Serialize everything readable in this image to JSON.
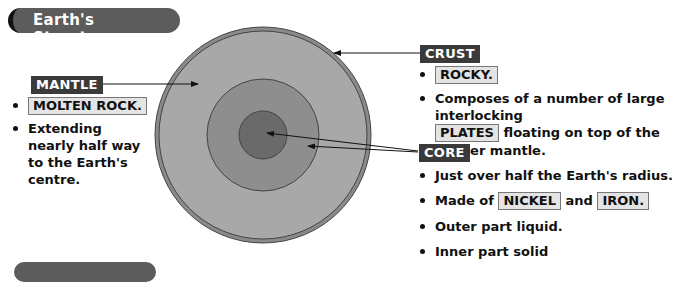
{
  "header": {
    "title": "Earth's Structure"
  },
  "diagram": {
    "colors": {
      "crust": "#8a8a8a",
      "mantle": "#a8a8a8",
      "outer_core": "#8e8e8e",
      "inner_core": "#6a6a6a",
      "label_bg": "#3a3a3a",
      "highlight_bg": "#e4e4e4"
    }
  },
  "mantle": {
    "label": "MANTLE",
    "bullets": [
      {
        "highlight": "MOLTEN ROCK."
      },
      {
        "text": "Extending nearly half way to the Earth's centre."
      }
    ]
  },
  "crust": {
    "label": "CRUST",
    "bullets": [
      {
        "highlight": "ROCKY."
      },
      {
        "text_before": "Composes of a number of large interlocking",
        "highlight": "PLATES",
        "text_after": "floating on top of the denser mantle."
      }
    ]
  },
  "core": {
    "label": "CORE",
    "bullets": [
      {
        "text": "Just over half the Earth's radius."
      },
      {
        "text_before": "Made of",
        "highlight1": "NICKEL",
        "text_mid": "and",
        "highlight2": "IRON."
      },
      {
        "text": "Outer part liquid."
      },
      {
        "text": "Inner part solid"
      }
    ]
  }
}
